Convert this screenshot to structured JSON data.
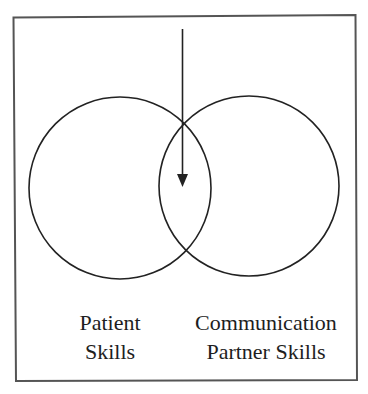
{
  "diagram": {
    "type": "venn",
    "frame_color": "#555555",
    "line_color": "#222222",
    "circles": [
      {
        "name": "patient",
        "cx": 120,
        "cy": 188,
        "r": 91
      },
      {
        "name": "partner",
        "cx": 249,
        "cy": 186,
        "r": 90
      }
    ],
    "arrow": {
      "x": 182,
      "y1": 29,
      "y2": 186,
      "direction": "down",
      "points_to": "overlap"
    },
    "labels": {
      "left": {
        "line1": "Patient",
        "line2": "Skills"
      },
      "right": {
        "line1": "Communication",
        "line2": "Partner Skills"
      }
    }
  }
}
